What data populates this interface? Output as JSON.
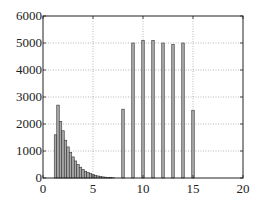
{
  "chart_data": {
    "type": "bar",
    "title": "",
    "xlabel": "",
    "ylabel": "",
    "xlim": [
      0,
      20
    ],
    "ylim": [
      0,
      6000
    ],
    "grid": true,
    "legend": null,
    "x_ticks": [
      "0",
      "5",
      "10",
      "15",
      "20"
    ],
    "y_ticks": [
      "0",
      "1000",
      "2000",
      "3000",
      "4000",
      "5000",
      "6000"
    ],
    "bar_width": 0.25,
    "x": [
      1.25,
      1.5,
      1.75,
      2.0,
      2.25,
      2.5,
      2.75,
      3.0,
      3.25,
      3.5,
      3.75,
      4.0,
      4.25,
      4.5,
      4.75,
      5.0,
      5.25,
      5.5,
      5.75,
      6.0,
      6.25,
      6.5,
      6.75,
      7.0,
      8.0,
      9.0,
      10.0,
      11.0,
      12.0,
      13.0,
      14.0,
      15.0
    ],
    "values": [
      1600,
      2700,
      2100,
      1750,
      1400,
      1150,
      950,
      780,
      630,
      500,
      400,
      320,
      250,
      200,
      160,
      130,
      100,
      75,
      55,
      40,
      30,
      20,
      12,
      8,
      2550,
      5000,
      5100,
      5100,
      5000,
      4950,
      5000,
      2500
    ]
  },
  "axes": {
    "x_tick_labels": [
      "0",
      "5",
      "10",
      "15",
      "20"
    ],
    "y_tick_labels": [
      "0",
      "1000",
      "2000",
      "3000",
      "4000",
      "5000",
      "6000"
    ]
  },
  "colors": {
    "bar_fill": "#a8a8a8",
    "bar_edge": "#333333",
    "axis": "#222222",
    "grid": "#9a9a9a"
  }
}
